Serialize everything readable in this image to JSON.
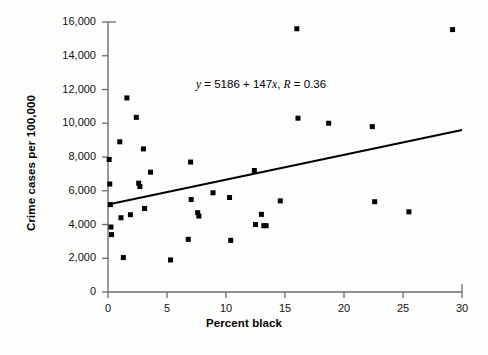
{
  "chart_data": {
    "type": "scatter",
    "title": "",
    "xlabel": "Percent black",
    "ylabel": "Crime cases per 100,000",
    "xlim": [
      0,
      30
    ],
    "ylim": [
      0,
      16000
    ],
    "xticks": [
      0,
      5,
      10,
      15,
      20,
      25,
      30
    ],
    "xtick_labels": [
      "0",
      "5",
      "10",
      "15",
      "20",
      "25",
      "30"
    ],
    "yticks": [
      0,
      2000,
      4000,
      6000,
      8000,
      10000,
      12000,
      14000,
      16000
    ],
    "ytick_labels": [
      "0",
      "2,000",
      "4,000",
      "6,000",
      "8,000",
      "10,000",
      "12,000",
      "14,000",
      "16,000"
    ],
    "grid": false,
    "legend": null,
    "annotation": "y = 5186 + 147x, R = 0.36",
    "annotation_parts": {
      "y_symbol": "y",
      "eq1": " = 5186 + 147",
      "x_symbol": "x",
      "eq2": ", ",
      "r_symbol": "R",
      "eq3": " = 0.36"
    },
    "fit": {
      "type": "linear",
      "intercept": 5186,
      "slope": 147,
      "r": 0.36,
      "x_start": 0,
      "x_end": 30,
      "y_start": 5186,
      "y_end": 9596
    },
    "marker": {
      "shape": "square",
      "color": "#000000",
      "size": 5
    },
    "points": [
      {
        "x": 0.1,
        "y": 7850
      },
      {
        "x": 0.15,
        "y": 6400
      },
      {
        "x": 0.2,
        "y": 5180
      },
      {
        "x": 0.25,
        "y": 3850
      },
      {
        "x": 0.3,
        "y": 3400
      },
      {
        "x": 1.0,
        "y": 8900
      },
      {
        "x": 1.1,
        "y": 4400
      },
      {
        "x": 1.3,
        "y": 2040
      },
      {
        "x": 1.6,
        "y": 11500
      },
      {
        "x": 1.9,
        "y": 4580
      },
      {
        "x": 2.4,
        "y": 10350
      },
      {
        "x": 2.6,
        "y": 6450
      },
      {
        "x": 2.7,
        "y": 6250
      },
      {
        "x": 3.0,
        "y": 8480
      },
      {
        "x": 3.1,
        "y": 4950
      },
      {
        "x": 3.6,
        "y": 7100
      },
      {
        "x": 5.3,
        "y": 1900
      },
      {
        "x": 6.8,
        "y": 3120
      },
      {
        "x": 7.0,
        "y": 7700
      },
      {
        "x": 7.05,
        "y": 5480
      },
      {
        "x": 7.6,
        "y": 4700
      },
      {
        "x": 7.7,
        "y": 4500
      },
      {
        "x": 8.9,
        "y": 5880
      },
      {
        "x": 10.3,
        "y": 5600
      },
      {
        "x": 10.4,
        "y": 3060
      },
      {
        "x": 12.4,
        "y": 7200
      },
      {
        "x": 12.5,
        "y": 4000
      },
      {
        "x": 13.0,
        "y": 4600
      },
      {
        "x": 13.2,
        "y": 3930
      },
      {
        "x": 13.4,
        "y": 3930
      },
      {
        "x": 14.6,
        "y": 5400
      },
      {
        "x": 16.0,
        "y": 15600
      },
      {
        "x": 16.1,
        "y": 10300
      },
      {
        "x": 18.7,
        "y": 10000
      },
      {
        "x": 22.4,
        "y": 9800
      },
      {
        "x": 22.6,
        "y": 5350
      },
      {
        "x": 25.5,
        "y": 4750
      },
      {
        "x": 29.2,
        "y": 15550
      }
    ]
  }
}
